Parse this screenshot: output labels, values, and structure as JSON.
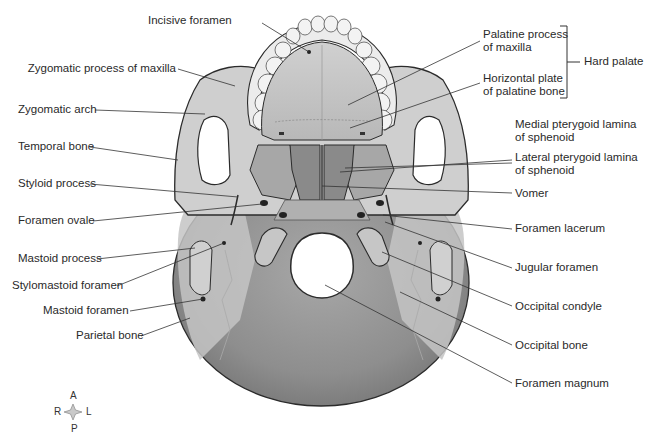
{
  "figure": {
    "colors": {
      "bone_light": "#d9d9d9",
      "bone_mid": "#b5b5b5",
      "occipital": "#8f8f8f",
      "outline": "#2b2b2b",
      "leader": "#333333",
      "text": "#2a2a2a"
    }
  },
  "labels_left": [
    {
      "text": "Incisive foramen"
    },
    {
      "text": "Zygomatic process of maxilla"
    },
    {
      "text": "Zygomatic arch"
    },
    {
      "text": "Temporal bone"
    },
    {
      "text": "Styloid process"
    },
    {
      "text": "Foramen ovale"
    },
    {
      "text": "Mastoid process"
    },
    {
      "text": "Stylomastoid foramen"
    },
    {
      "text": "Mastoid foramen"
    },
    {
      "text": "Parietal bone"
    }
  ],
  "labels_right": [
    {
      "line1": "Palatine process",
      "line2": "of maxilla"
    },
    {
      "line1": "Horizontal plate",
      "line2": "of palatine bone"
    },
    {
      "line1": "Medial pterygoid lamina",
      "line2": "of sphenoid"
    },
    {
      "line1": "Lateral pterygoid lamina",
      "line2": "of sphenoid"
    },
    {
      "text": "Vomer"
    },
    {
      "text": "Foramen lacerum"
    },
    {
      "text": "Jugular foramen"
    },
    {
      "text": "Occipital condyle"
    },
    {
      "text": "Occipital bone"
    },
    {
      "text": "Foramen magnum"
    }
  ],
  "bracket": {
    "text": "Hard palate"
  },
  "compass": {
    "anterior": "A",
    "posterior": "P",
    "right": "R",
    "left": "L"
  }
}
